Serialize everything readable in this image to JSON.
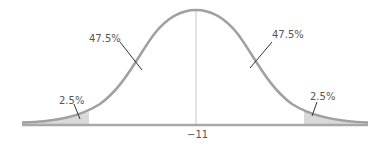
{
  "diagram": {
    "title": "",
    "type": "normal-distribution",
    "mean_label": "−11",
    "regions": [
      {
        "id": "left-tail",
        "label": "2.5%"
      },
      {
        "id": "left-center",
        "label": "47.5%"
      },
      {
        "id": "right-center",
        "label": "47.5%"
      },
      {
        "id": "right-tail",
        "label": "2.5%"
      }
    ],
    "colors": {
      "curve": "#a0a0a0",
      "baseline": "#a8a8a8",
      "tail_fill": "#d9d9d9",
      "center_line": "#c8c8c8",
      "leader": "#333333",
      "text": "#555555"
    }
  }
}
